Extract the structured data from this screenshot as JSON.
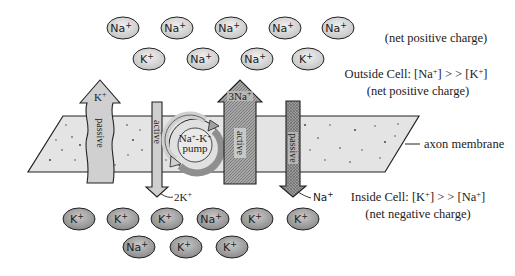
{
  "diagram": {
    "colors": {
      "ion_outside_fill": "#d6d6d6",
      "ion_inside_fill": "#9e9e9e",
      "membrane_fill": "#e3e3e3",
      "passive_arrow_fill": "#cfcfcf",
      "active_arrow_dark": "#8d8d8d",
      "stroke": "#222222"
    },
    "outside_ions": {
      "row1": [
        {
          "symbol": "Na",
          "charge": "+"
        },
        {
          "symbol": "Na",
          "charge": "+"
        },
        {
          "symbol": "Na",
          "charge": "+"
        },
        {
          "symbol": "Na",
          "charge": "+"
        },
        {
          "symbol": "Na",
          "charge": "+"
        }
      ],
      "row2": [
        {
          "symbol": "K",
          "charge": "+"
        },
        {
          "symbol": "Na",
          "charge": "+"
        },
        {
          "symbol": "Na",
          "charge": "+"
        },
        {
          "symbol": "K",
          "charge": "+"
        }
      ]
    },
    "inside_ions": {
      "row1": [
        {
          "symbol": "K",
          "charge": "+"
        },
        {
          "symbol": "K",
          "charge": "+"
        },
        {
          "symbol": "K",
          "charge": "+"
        },
        {
          "symbol": "Na",
          "charge": "+"
        },
        {
          "symbol": "K",
          "charge": "+"
        },
        {
          "symbol": "K",
          "charge": "+"
        }
      ],
      "row2": [
        {
          "symbol": "Na",
          "charge": "+"
        },
        {
          "symbol": "K",
          "charge": "+"
        },
        {
          "symbol": "K",
          "charge": "+"
        }
      ]
    },
    "arrows": {
      "k_passive": {
        "ion": "K",
        "charge": "+",
        "type": "passive",
        "direction": "out"
      },
      "k_active": {
        "ion": "2K",
        "charge": "+",
        "type": "active",
        "direction": "in"
      },
      "na_active": {
        "ion": "3Na",
        "charge": "+",
        "type": "active",
        "direction": "out"
      },
      "na_passive": {
        "ion": "Na",
        "charge": "+",
        "type": "passive",
        "direction": "in"
      }
    },
    "pump": {
      "line1": "Na",
      "line1_sup": "+",
      "line1_mid": "-K",
      "line1_sup2": "+",
      "line2": "pump"
    },
    "labels": {
      "top_note": "(net positive charge)",
      "outside_title": "Outside Cell: [Na",
      "outside_title_sup1": "+",
      "outside_title_mid": "] > > [K",
      "outside_title_sup2": "+",
      "outside_title_end": "]",
      "outside_note": "(net positive charge)",
      "membrane": "axon membrane",
      "inside_title": "Inside Cell: [K",
      "inside_title_sup1": "+",
      "inside_title_mid": "] > > [Na",
      "inside_title_sup2": "+",
      "inside_title_end": "]",
      "inside_note": "(net negative charge)"
    }
  }
}
